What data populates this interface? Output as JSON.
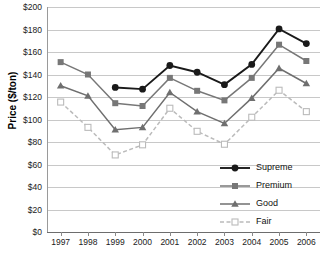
{
  "chart_data": {
    "type": "line",
    "title": "",
    "xlabel": "",
    "ylabel": "Price ($/ton)",
    "ylim": [
      0,
      200
    ],
    "ytick_step": 20,
    "grid": true,
    "legend_position": "bottom-right",
    "categories": [
      "1997",
      "1998",
      "1999",
      "2000",
      "2001",
      "2002",
      "2003",
      "2004",
      "2005",
      "2006"
    ],
    "series": [
      {
        "name": "Supreme",
        "color": "#1a1a1a",
        "marker": "circle-filled",
        "line_style": "solid",
        "values": [
          null,
          null,
          128.5,
          127,
          148,
          142,
          131,
          149,
          180.5,
          167.5
        ]
      },
      {
        "name": "Premium",
        "color": "#777777",
        "marker": "square-filled",
        "line_style": "solid",
        "values": [
          151,
          140,
          114.5,
          112,
          137,
          125.5,
          117,
          137,
          166.5,
          152
        ]
      },
      {
        "name": "Good",
        "color": "#6f6f6f",
        "marker": "triangle-filled",
        "line_style": "solid",
        "values": [
          130,
          121,
          91,
          93,
          124,
          107,
          96.5,
          119,
          145.5,
          132
        ]
      },
      {
        "name": "Fair",
        "color": "#bbbbbb",
        "marker": "square-open",
        "line_style": "dashed",
        "values": [
          115.5,
          93,
          68.5,
          77.5,
          110,
          89.5,
          78,
          102,
          126,
          107
        ]
      }
    ],
    "ytick_labels": [
      "$0",
      "$20",
      "$40",
      "$60",
      "$80",
      "$100",
      "$120",
      "$140",
      "$160",
      "$180",
      "$200"
    ]
  },
  "legend": {
    "items": [
      {
        "label": "Supreme"
      },
      {
        "label": "Premium"
      },
      {
        "label": "Good"
      },
      {
        "label": "Fair"
      }
    ]
  }
}
